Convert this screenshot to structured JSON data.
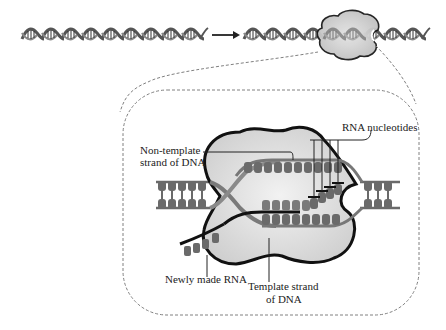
{
  "diagram": {
    "type": "biological-process",
    "arrow": "→",
    "labels": {
      "non_template_line1": "Non-template",
      "non_template_line2": "strand of DNA",
      "rna_nucleotides": "RNA nucleotides",
      "newly_made_rna": "Newly made RNA",
      "template_line1": "Template strand",
      "template_line2": "of DNA"
    },
    "sequences": {
      "left_dna_top": [
        "G",
        "G",
        "A",
        "A",
        "A"
      ],
      "left_dna_bottom": [
        "C",
        "C",
        "T",
        "T",
        "T"
      ],
      "non_template_strand": [
        "T",
        "G",
        "T",
        "A",
        "T",
        "A",
        "G",
        "T",
        "A",
        "C",
        "C"
      ],
      "template_strand": [
        "A",
        "C",
        "A",
        "T",
        "A",
        "T",
        "C",
        "A",
        "T",
        "G",
        "G"
      ],
      "rna_strand": [
        "U",
        "G",
        "U",
        "A",
        "U",
        "A",
        "G",
        "U"
      ],
      "incoming_rna_nucleotides": [
        "A",
        "C",
        "C",
        "U"
      ],
      "right_dna_top": [
        "U",
        "A",
        "A",
        "C"
      ],
      "right_dna_bottom": [
        "A",
        "T",
        "T",
        "G"
      ],
      "exiting_rna": [
        "A",
        "A",
        "U"
      ]
    },
    "colors": {
      "polymerase_fill": "#d8d8d8",
      "polymerase_outline": "#1a1a1a",
      "strand": "#6e6e6e",
      "base": "#5a5a5a",
      "dashed_line": "#7a7a7a"
    }
  }
}
